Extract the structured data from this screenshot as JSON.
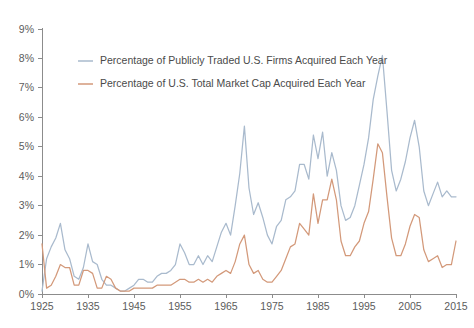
{
  "chart_data": {
    "type": "line",
    "title": "",
    "subtitle": "",
    "xlabel": "",
    "ylabel": "",
    "xlim": [
      1925,
      2015
    ],
    "ylim": [
      0,
      9
    ],
    "grid": false,
    "legend_position": "top-left",
    "y_tick_labels": [
      "0%",
      "1%",
      "2%",
      "3%",
      "4%",
      "5%",
      "6%",
      "7%",
      "8%",
      "9%"
    ],
    "y_tick_values": [
      0,
      1,
      2,
      3,
      4,
      5,
      6,
      7,
      8,
      9
    ],
    "x_tick_labels": [
      "1925",
      "1935",
      "1945",
      "1955",
      "1965",
      "1975",
      "1985",
      "1995",
      "2005",
      "2015"
    ],
    "x_tick_values": [
      1925,
      1935,
      1945,
      1955,
      1965,
      1975,
      1985,
      1995,
      2005,
      2015
    ],
    "colors": {
      "firms": "#a9bacd",
      "market_cap": "#d3997a",
      "axis": "#8c8c8c",
      "text": "#5c5c5c",
      "background": "#ffffff"
    },
    "x": [
      1925,
      1926,
      1927,
      1928,
      1929,
      1930,
      1931,
      1932,
      1933,
      1934,
      1935,
      1936,
      1937,
      1938,
      1939,
      1940,
      1941,
      1942,
      1943,
      1944,
      1945,
      1946,
      1947,
      1948,
      1949,
      1950,
      1951,
      1952,
      1953,
      1954,
      1955,
      1956,
      1957,
      1958,
      1959,
      1960,
      1961,
      1962,
      1963,
      1964,
      1965,
      1966,
      1967,
      1968,
      1969,
      1970,
      1971,
      1972,
      1973,
      1974,
      1975,
      1976,
      1977,
      1978,
      1979,
      1980,
      1981,
      1982,
      1983,
      1984,
      1985,
      1986,
      1987,
      1988,
      1989,
      1990,
      1991,
      1992,
      1993,
      1994,
      1995,
      1996,
      1997,
      1998,
      1999,
      2000,
      2001,
      2002,
      2003,
      2004,
      2005,
      2006,
      2007,
      2008,
      2009,
      2010,
      2011,
      2012,
      2013,
      2014,
      2015
    ],
    "series": [
      {
        "name": "Percentage of Publicly Traded U.S. Firms Acquired Each Year",
        "color": "#a9bacd",
        "values": [
          0.1,
          1.2,
          1.6,
          1.9,
          2.4,
          1.5,
          1.2,
          0.6,
          0.5,
          0.9,
          1.7,
          1.1,
          1.0,
          0.5,
          0.3,
          0.3,
          0.2,
          0.1,
          0.1,
          0.2,
          0.3,
          0.5,
          0.5,
          0.4,
          0.4,
          0.6,
          0.7,
          0.7,
          0.8,
          1.0,
          1.7,
          1.4,
          1.0,
          1.0,
          1.3,
          1.0,
          1.3,
          1.1,
          1.6,
          2.1,
          2.4,
          2.0,
          3.0,
          4.1,
          5.7,
          3.6,
          2.7,
          3.1,
          2.6,
          2.0,
          1.7,
          2.3,
          2.5,
          3.2,
          3.3,
          3.5,
          4.4,
          4.4,
          3.9,
          5.4,
          4.6,
          5.5,
          4.0,
          4.8,
          4.2,
          3.0,
          2.5,
          2.6,
          3.0,
          3.7,
          4.4,
          5.3,
          6.6,
          7.4,
          8.1,
          6.2,
          4.2,
          3.5,
          3.9,
          4.5,
          5.3,
          5.9,
          5.0,
          3.5,
          3.0,
          3.4,
          3.8,
          3.3,
          3.5,
          3.3,
          3.3
        ]
      },
      {
        "name": "Percentage of U.S. Total Market Cap Acquired Each Year",
        "color": "#d3997a",
        "values": [
          1.7,
          0.2,
          0.3,
          0.6,
          1.0,
          0.9,
          0.9,
          0.3,
          0.3,
          0.8,
          0.8,
          0.7,
          0.2,
          0.2,
          0.6,
          0.5,
          0.2,
          0.1,
          0.1,
          0.1,
          0.2,
          0.2,
          0.2,
          0.2,
          0.2,
          0.3,
          0.3,
          0.3,
          0.3,
          0.4,
          0.5,
          0.5,
          0.4,
          0.4,
          0.5,
          0.4,
          0.5,
          0.4,
          0.6,
          0.7,
          0.8,
          0.7,
          1.1,
          1.7,
          2.0,
          1.0,
          0.7,
          0.8,
          0.5,
          0.4,
          0.4,
          0.6,
          0.8,
          1.2,
          1.6,
          1.7,
          2.4,
          2.2,
          2.0,
          3.4,
          2.4,
          3.2,
          3.2,
          3.9,
          3.2,
          1.8,
          1.3,
          1.3,
          1.6,
          1.8,
          2.4,
          2.8,
          3.9,
          5.1,
          4.8,
          3.3,
          1.9,
          1.3,
          1.3,
          1.7,
          2.3,
          2.7,
          2.6,
          1.5,
          1.1,
          1.2,
          1.3,
          0.9,
          1.0,
          1.0,
          1.8
        ]
      }
    ],
    "legend": [
      {
        "label": "Percentage of Publicly Traded U.S. Firms Acquired Each Year",
        "color": "#a9bacd"
      },
      {
        "label": "Percentage of U.S. Total Market Cap Acquired Each Year",
        "color": "#d3997a"
      }
    ]
  }
}
